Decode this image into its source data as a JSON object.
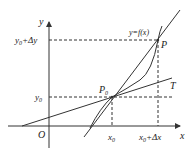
{
  "figure": {
    "type": "derivative-geometric-meaning",
    "colors": {
      "stroke": "#333333",
      "background": "#ffffff"
    },
    "axes": {
      "x_label": "x",
      "y_label": "y",
      "origin_label": "O"
    },
    "curve": {
      "label": "y=f(x)"
    },
    "points": {
      "p0": {
        "label": "P",
        "subscript": "0"
      },
      "p": {
        "label": "P"
      }
    },
    "tangent": {
      "label": "T"
    },
    "x_ticks": {
      "x0": {
        "base": "x",
        "sub": "0",
        "rest": ""
      },
      "x0_dx": {
        "base": "x",
        "sub": "0",
        "rest": "+Δx"
      }
    },
    "y_ticks": {
      "y0": {
        "base": "y",
        "sub": "0",
        "rest": ""
      },
      "y0_dy": {
        "base": "y",
        "sub": "0",
        "rest": "+Δy"
      }
    }
  }
}
